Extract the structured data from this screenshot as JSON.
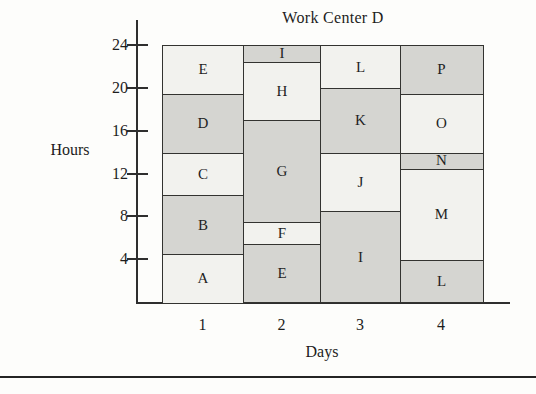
{
  "page": {
    "background": "#fdfdfb"
  },
  "chart_data": {
    "type": "bar",
    "subtype": "stacked-schedule-load-chart",
    "title": "Work Center D",
    "xlabel": "Days",
    "ylabel": "Hours",
    "x_categories": [
      "1",
      "2",
      "3",
      "4"
    ],
    "yticks": [
      24,
      20,
      16,
      12,
      8,
      4
    ],
    "ylim": [
      0,
      24
    ],
    "grid": false,
    "legend": false,
    "colors": {
      "light_block": "#f2f2ee",
      "shaded_block": "#d5d5d1",
      "border": "#333330"
    },
    "columns": [
      {
        "day": "1",
        "blocks": [
          {
            "job": "A",
            "start": 0,
            "end": 4.5,
            "fill": "light"
          },
          {
            "job": "B",
            "start": 4.5,
            "end": 10,
            "fill": "shaded"
          },
          {
            "job": "C",
            "start": 10,
            "end": 14,
            "fill": "light"
          },
          {
            "job": "D",
            "start": 14,
            "end": 19.5,
            "fill": "shaded"
          },
          {
            "job": "E",
            "start": 19.5,
            "end": 24,
            "fill": "light"
          }
        ]
      },
      {
        "day": "2",
        "blocks": [
          {
            "job": "E",
            "start": 0,
            "end": 5.5,
            "fill": "shaded"
          },
          {
            "job": "F",
            "start": 5.5,
            "end": 7.5,
            "fill": "light"
          },
          {
            "job": "G",
            "start": 7.5,
            "end": 17,
            "fill": "shaded"
          },
          {
            "job": "H",
            "start": 17,
            "end": 22.5,
            "fill": "light"
          },
          {
            "job": "I",
            "start": 22.5,
            "end": 24,
            "fill": "shaded"
          }
        ]
      },
      {
        "day": "3",
        "blocks": [
          {
            "job": "I",
            "start": 0,
            "end": 8.5,
            "fill": "shaded"
          },
          {
            "job": "J",
            "start": 8.5,
            "end": 14,
            "fill": "light"
          },
          {
            "job": "K",
            "start": 14,
            "end": 20,
            "fill": "shaded"
          },
          {
            "job": "L",
            "start": 20,
            "end": 24,
            "fill": "light"
          }
        ]
      },
      {
        "day": "4",
        "blocks": [
          {
            "job": "L",
            "start": 0,
            "end": 4,
            "fill": "shaded"
          },
          {
            "job": "M",
            "start": 4,
            "end": 12.5,
            "fill": "light"
          },
          {
            "job": "N",
            "start": 12.5,
            "end": 14,
            "fill": "shaded"
          },
          {
            "job": "O",
            "start": 14,
            "end": 19.5,
            "fill": "light"
          },
          {
            "job": "P",
            "start": 19.5,
            "end": 24,
            "fill": "shaded"
          }
        ]
      }
    ]
  }
}
